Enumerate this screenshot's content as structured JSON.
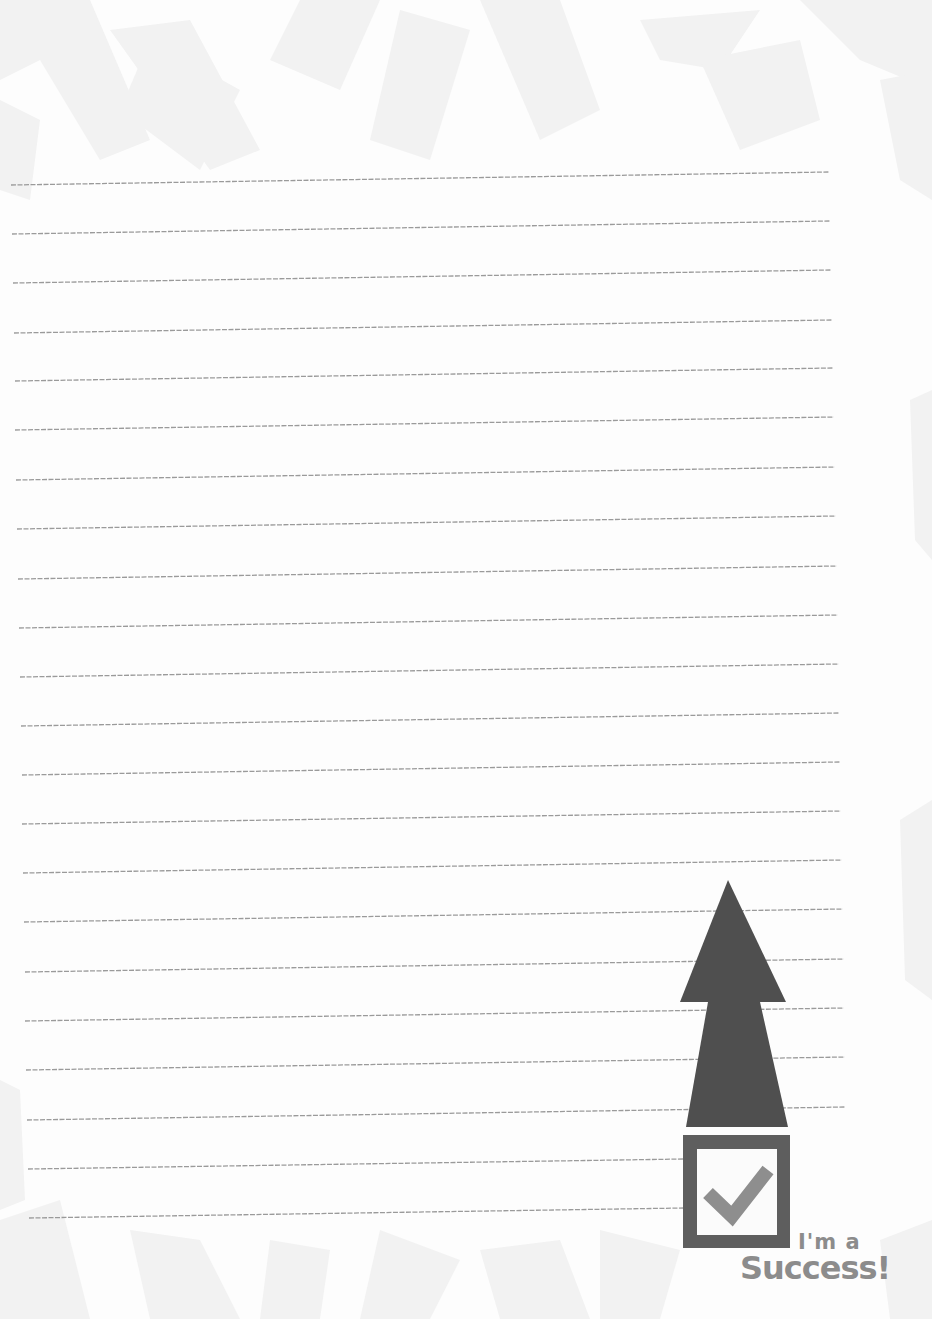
{
  "page": {
    "type": "lined-notepaper",
    "background_color": "#fdfdfd",
    "pattern_color": "#f1f1f1",
    "line_color": "#9a9a9a",
    "line_count": 22,
    "line_spacing_px": 49,
    "first_line_y": 183
  },
  "emblem": {
    "arrow": {
      "icon": "up-arrow-icon",
      "color": "#4f4f4f"
    },
    "checkbox": {
      "icon": "checked-box-icon",
      "frame_color": "#5e5e5e",
      "check_color": "#8e8e8e",
      "checked": true
    },
    "caption": {
      "line1": "I'm a",
      "line2": "Success!"
    }
  }
}
